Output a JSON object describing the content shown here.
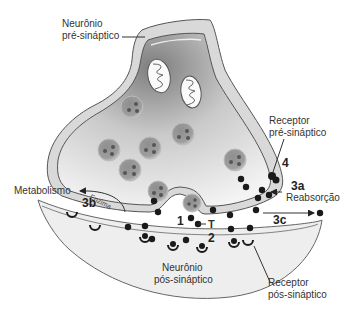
{
  "diagram": {
    "type": "synapse-schematic",
    "labels": {
      "pre_neuron_line1": "Neurônio",
      "pre_neuron_line2": "pré-sináptico",
      "pre_receptor_line1": "Receptor",
      "pre_receptor_line2": "pré-sináptico",
      "post_neuron_line1": "Neurônio",
      "post_neuron_line2": "pós-sináptico",
      "post_receptor_line1": "Receptor",
      "post_receptor_line2": "pós-sináptico",
      "metabolism": "Metabolismo",
      "enzyme": "Enzima",
      "reuptake": "Reabsorção",
      "transmitter": "T"
    },
    "step_numbers": {
      "release": "1",
      "binding": "2",
      "reuptake": "3a",
      "enzymatic_degradation": "3b",
      "diffusion": "3c",
      "autoreceptor": "4"
    },
    "colors": {
      "membrane_fill": "#d9d9d9",
      "membrane_stroke": "#555555",
      "cytoplasm_dark": "#8a8a8a",
      "cytoplasm_light": "#f2f2f2",
      "postsynaptic_fill": "#eeeeee",
      "vesicle_fill": "#9a9a9a",
      "dot": "#1a1a1a",
      "text": "#333333"
    }
  }
}
